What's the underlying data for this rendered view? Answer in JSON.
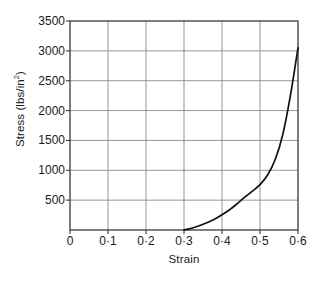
{
  "chart_data": {
    "type": "line",
    "title": "",
    "xlabel": "Strain",
    "ylabel": "Stress (lbs/in2)",
    "ylabel_base": "Stress (lbs/in",
    "ylabel_sup": "2",
    "ylabel_close": ")",
    "xlim": [
      0,
      0.6
    ],
    "ylim": [
      0,
      3500
    ],
    "grid": true,
    "legend": null,
    "xticks": [
      0,
      0.1,
      0.2,
      0.3,
      0.4,
      0.5,
      0.6
    ],
    "xticklabels": [
      "0",
      "0·1",
      "0·2",
      "0·3",
      "0·4",
      "0·5",
      "0·6"
    ],
    "yticks": [
      500,
      1000,
      1500,
      2000,
      2500,
      3000,
      3500
    ],
    "yticklabels": [
      "500",
      "1000",
      "1500",
      "2000",
      "2500",
      "3000",
      "3500"
    ],
    "series": [
      {
        "name": "stress-strain curve",
        "color": "#111111",
        "x": [
          0.3,
          0.32,
          0.34,
          0.36,
          0.38,
          0.4,
          0.42,
          0.44,
          0.46,
          0.48,
          0.5,
          0.52,
          0.54,
          0.56,
          0.58,
          0.6
        ],
        "y": [
          0,
          30,
          70,
          120,
          180,
          255,
          340,
          440,
          550,
          650,
          760,
          920,
          1180,
          1600,
          2250,
          3050
        ]
      }
    ]
  },
  "axes": {
    "grid_color": "#8a8a8a",
    "frame_color": "#3a3a3a",
    "background": "#ffffff"
  }
}
